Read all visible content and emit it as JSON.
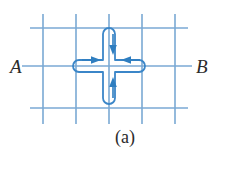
{
  "figure": {
    "caption": "(a)",
    "background_color": "#ffffff",
    "grid_color": "#7aa9d4",
    "path_color": "#3b86c8",
    "arrow_color": "#2f7ec0",
    "label_color": "#2b2b2b"
  },
  "labels": {
    "left_terminal": "A",
    "right_terminal": "B"
  },
  "grid": {
    "vertical_line_x": [
      43,
      76,
      109,
      142,
      175
    ],
    "vertical_line_y_top": 14,
    "vertical_line_y_bottom": 124,
    "horizontal_line_y": [
      28,
      66,
      108
    ],
    "horizontal_line_x_left": 30,
    "horizontal_line_x_right": 188,
    "lead_left_x_start": 22,
    "lead_right_x_end": 192
  },
  "cross_path": {
    "center_x": 109,
    "center_y": 66,
    "arm_half_width": 6,
    "arm_extent_horizontal": 30,
    "arm_extent_vertical": 38,
    "corner_radius": 6
  },
  "arrows": [
    {
      "name": "top-arm-arrow",
      "direction": "down",
      "x": 113,
      "y_start": 34,
      "y_end": 52
    },
    {
      "name": "bottom-arm-arrow",
      "direction": "up",
      "x": 113,
      "y_start": 98,
      "y_end": 80
    },
    {
      "name": "left-arm-arrow",
      "direction": "right",
      "y": 60,
      "x_start": 82,
      "x_end": 100
    },
    {
      "name": "right-arm-arrow",
      "direction": "left",
      "y": 60,
      "x_start": 136,
      "x_end": 118
    }
  ]
}
